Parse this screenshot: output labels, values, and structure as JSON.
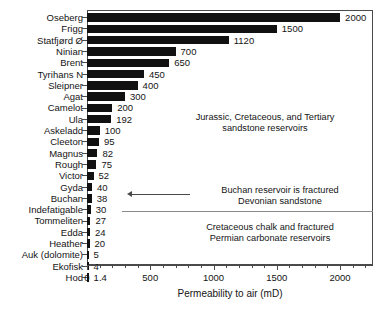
{
  "chart_data": {
    "type": "bar",
    "orientation": "horizontal",
    "title": "",
    "xlabel": "Permeability to air (mD)",
    "ylabel": "",
    "xlim": [
      0,
      2260
    ],
    "xticks": [
      0,
      500,
      1000,
      1500,
      2000
    ],
    "xticklabels": [
      "0",
      "500",
      "1000",
      "1500",
      "2000"
    ],
    "grid": false,
    "legend": false,
    "categories": [
      "Oseberg",
      "Frigg",
      "Statfjørd Ø",
      "Ninian",
      "Brent",
      "Tyrihans N",
      "Sleipner",
      "Agat",
      "Camelot",
      "Ula",
      "Askeladd",
      "Cleeton",
      "Magnus",
      "Rough",
      "Victor",
      "Gyda",
      "Buchan",
      "Indefatigable",
      "Tommeliten",
      "Edda",
      "Heather",
      "Auk (dolomite)",
      "Ekofisk",
      "Hod"
    ],
    "values": [
      2000,
      1500,
      1120,
      700,
      650,
      450,
      400,
      300,
      200,
      192,
      100,
      95,
      82,
      75,
      52,
      40,
      38,
      30,
      27,
      24,
      20,
      5,
      4,
      1.4
    ],
    "value_labels": [
      "2000",
      "1500",
      "1120",
      "700",
      "650",
      "450",
      "400",
      "300",
      "200",
      "192",
      "100",
      "95",
      "82",
      "75",
      "52",
      "40",
      "38",
      "30",
      "27",
      "24",
      "20",
      "5",
      "4",
      "1.4"
    ],
    "bar_color": "#111111",
    "annotations": [
      {
        "id": "sandstone-note",
        "line1": "Jurassic, Cretaceous, and Tertiary",
        "line2": "sandstone reservoirs"
      },
      {
        "id": "buchan-note",
        "line1": "Buchan reservoir is fractured",
        "line2": "Devonian sandstone"
      },
      {
        "id": "chalk-note",
        "line1": "Cretaceous chalk and fractured",
        "line2": "Permian carbonate reservoirs"
      }
    ]
  }
}
